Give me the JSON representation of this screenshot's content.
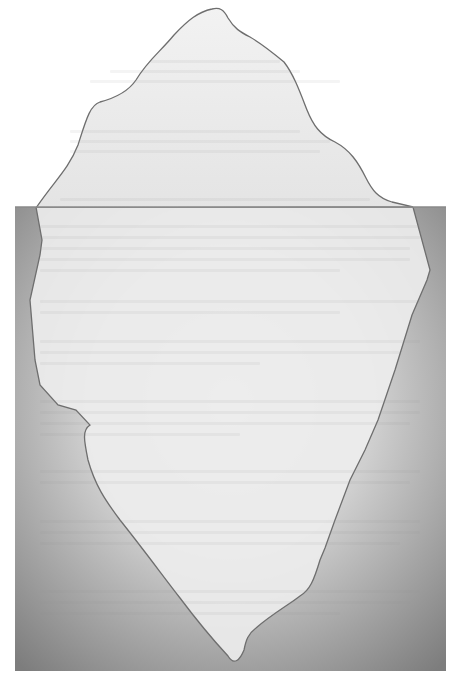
{
  "diagram": {
    "title": "Iceberg",
    "regions": [
      {
        "id": "above-water",
        "label": ""
      },
      {
        "id": "below-water",
        "label": ""
      }
    ],
    "colors": {
      "sky": "#ffffff",
      "ice_fill": "#ededed",
      "ice_outline": "#6e6e6e",
      "water_light": "#e6e6e6",
      "water_dark": "#7d7d7d",
      "waterline": "#8a8a8a"
    }
  }
}
